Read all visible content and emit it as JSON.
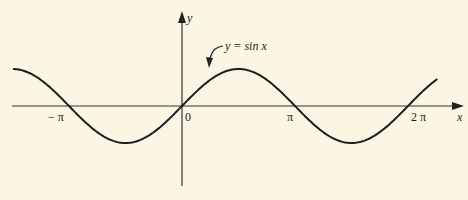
{
  "chart_data": {
    "type": "line",
    "title": "",
    "function_label": "y = sin x",
    "xlabel": "x",
    "ylabel": "y",
    "x_ticks": [
      "−π",
      "0",
      "π",
      "2π"
    ],
    "x_tick_values": [
      -3.14159,
      0,
      3.14159,
      6.28318
    ],
    "xlim": [
      -4.7,
      7.4
    ],
    "ylim": [
      -1,
      1
    ],
    "series": [
      {
        "name": "y = sin x",
        "function": "sin(x)",
        "domain": [
          -4.7,
          7.1
        ]
      }
    ],
    "grid": false,
    "legend": "none"
  },
  "labels": {
    "neg_pi": "− π",
    "zero": "0",
    "pi": "π",
    "two_pi": "2 π",
    "x_axis": "x",
    "y_axis": "y",
    "curve": "y = sin x"
  },
  "colors": {
    "background": "#fbf5e3",
    "ink": "#222222"
  }
}
